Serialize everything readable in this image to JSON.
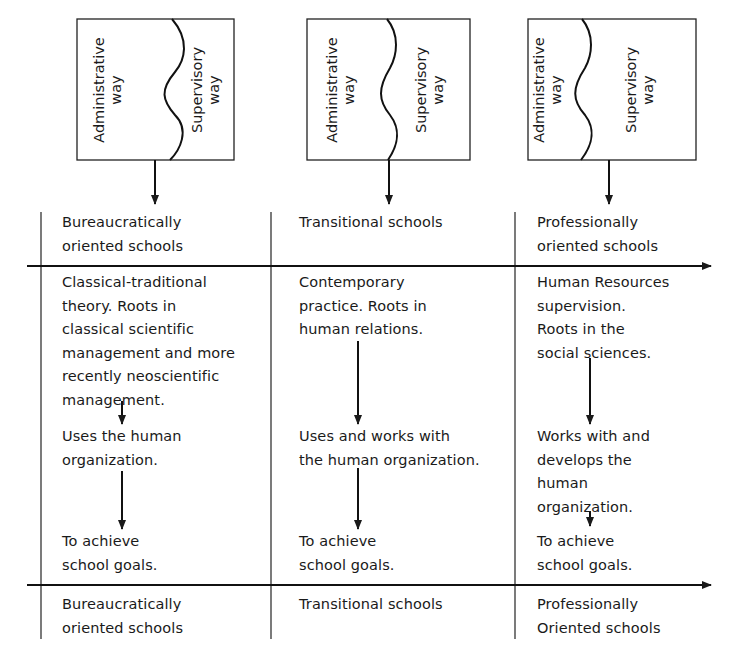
{
  "boxes": [
    {
      "left_label": "Administrative\nway",
      "right_label": "Supervisory\nway"
    },
    {
      "left_label": "Administrative\nway",
      "right_label": "Supervisory\nway"
    },
    {
      "left_label": "Administrative\nway",
      "right_label": "Supervisory\nway"
    }
  ],
  "top_row": [
    "Bureaucratically\noriented schools",
    "Transitional schools",
    "Professionally\noriented schools"
  ],
  "columns": [
    {
      "theory": "Classical-traditional\ntheory. Roots in\nclassical scientific\nmanagement and more\nrecently neoscientific\nmanagement.",
      "relation": "Uses the human\norganization.",
      "goal": "To achieve\nschool goals."
    },
    {
      "theory": "Contemporary\npractice. Roots in\nhuman relations.",
      "relation": "Uses and works with\nthe human organization.",
      "goal": "To achieve\nschool goals."
    },
    {
      "theory": "Human Resources\nsupervision.\nRoots in the\nsocial sciences.",
      "relation": "Works with and\ndevelops the\nhuman\norganization.",
      "goal": "To achieve\nschool goals."
    }
  ],
  "bottom_row": [
    "Bureaucratically\noriented schools",
    "Transitional schools",
    "Professionally\nOriented schools"
  ]
}
